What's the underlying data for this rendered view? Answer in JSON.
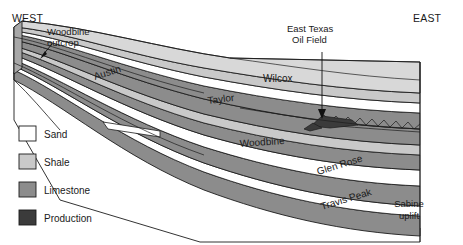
{
  "figure": {
    "width": 463,
    "height": 245,
    "background": "#ffffff"
  },
  "orientation": {
    "west_label": "WEST",
    "east_label": "EAST"
  },
  "annotations": [
    {
      "id": "woodbine-outcrop",
      "line1": "Woodbine",
      "line2": "outcrop",
      "pointer": "arrow-down-left"
    },
    {
      "id": "east-texas-oil-field",
      "line1": "East Texas",
      "line2": "Oil Field",
      "pointer": "arrow-down"
    }
  ],
  "strata_labels": [
    {
      "id": "austin",
      "text": "Austin",
      "rotation": -18
    },
    {
      "id": "wilcox",
      "text": "Wilcox",
      "rotation": 0
    },
    {
      "id": "taylor",
      "text": "Taylor",
      "rotation": -7
    },
    {
      "id": "woodbine",
      "text": "Woodbine",
      "rotation": -4
    },
    {
      "id": "glen-rose",
      "text": "Glen Rose",
      "rotation": -17
    },
    {
      "id": "travis-peak",
      "text": "Travis Peak",
      "rotation": -17
    }
  ],
  "region_labels": [
    {
      "id": "sabine-uplift",
      "line1": "Sabine",
      "line2": "uplift"
    }
  ],
  "legend": {
    "items": [
      {
        "label": "Sand",
        "color": "#ffffff"
      },
      {
        "label": "Shale",
        "color": "#c9c9c9"
      },
      {
        "label": "Limestone",
        "color": "#8c8c8c"
      },
      {
        "label": "Production",
        "color": "#3b3b3b"
      }
    ]
  },
  "palette": {
    "sand": "#ffffff",
    "shale": "#c9c9c9",
    "limestone": "#8c8c8c",
    "production": "#3b3b3b",
    "top_surface": "#d8d8d8",
    "outline": "#1c1c1c",
    "text": "#1a1a1a"
  }
}
